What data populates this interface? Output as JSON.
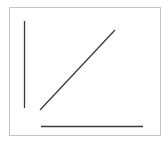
{
  "figure": {
    "width": 168,
    "height": 143,
    "background": "#ffffff",
    "frame": {
      "x": 9.5,
      "y": 7.5,
      "width": 151,
      "height": 128,
      "stroke": "#c4c4c4",
      "stroke_width": 1
    },
    "lines": [
      {
        "name": "vertical-line",
        "x1": 24.5,
        "y1": 21,
        "x2": 24.5,
        "y2": 108,
        "stroke": "#3a3a3a",
        "stroke_width": 1.3
      },
      {
        "name": "diagonal-line",
        "x1": 40,
        "y1": 110,
        "x2": 115,
        "y2": 30,
        "stroke": "#3a3a3a",
        "stroke_width": 1.2
      },
      {
        "name": "horizontal-line",
        "x1": 41,
        "y1": 126.5,
        "x2": 143,
        "y2": 126.5,
        "stroke": "#3a3a3a",
        "stroke_width": 1.5
      }
    ]
  }
}
